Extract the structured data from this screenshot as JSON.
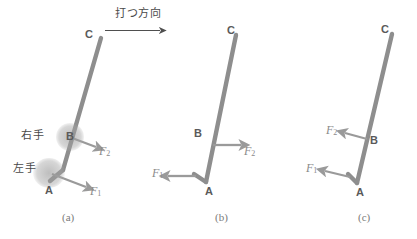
{
  "figure": {
    "direction_note": {
      "text": "打つ方向",
      "arrow": "rightwards-arrow"
    },
    "colors": {
      "rod": "#8e8e8e",
      "arrow": "#9a9a9a",
      "direction_arrow": "#4f4f4f",
      "point_label": "#5a5a5a",
      "force_label": "#8a8a8a",
      "japanese_label": "#4a4a4a",
      "caption": "#7a7a7a",
      "background": "#ffffff"
    },
    "panels": [
      {
        "caption": "(a)",
        "points": [
          {
            "name": "C",
            "label": "C"
          },
          {
            "name": "B",
            "label": "B"
          },
          {
            "name": "A",
            "label": "A"
          }
        ],
        "forces": [
          {
            "name": "F2",
            "label": "F",
            "sub": "2",
            "direction": "right-down",
            "at": "B"
          },
          {
            "name": "F1",
            "label": "F",
            "sub": "1",
            "direction": "right-down",
            "at": "A"
          }
        ],
        "hands": [
          {
            "name": "right-hand",
            "label": "右手",
            "at": "B"
          },
          {
            "name": "left-hand",
            "label": "左手",
            "at": "A"
          }
        ]
      },
      {
        "caption": "(b)",
        "points": [
          {
            "name": "C",
            "label": "C"
          },
          {
            "name": "B",
            "label": "B"
          },
          {
            "name": "A",
            "label": "A"
          }
        ],
        "forces": [
          {
            "name": "F2",
            "label": "F",
            "sub": "2",
            "direction": "right",
            "at": "B"
          },
          {
            "name": "F1",
            "label": "F",
            "sub": "1",
            "direction": "left",
            "at": "A"
          }
        ],
        "hands": []
      },
      {
        "caption": "(c)",
        "points": [
          {
            "name": "C",
            "label": "C"
          },
          {
            "name": "B",
            "label": "B"
          },
          {
            "name": "A",
            "label": "A"
          }
        ],
        "forces": [
          {
            "name": "F2",
            "label": "F",
            "sub": "2",
            "direction": "left",
            "at": "B"
          },
          {
            "name": "F1",
            "label": "F",
            "sub": "1",
            "direction": "left",
            "at": "A"
          }
        ],
        "hands": []
      }
    ]
  }
}
